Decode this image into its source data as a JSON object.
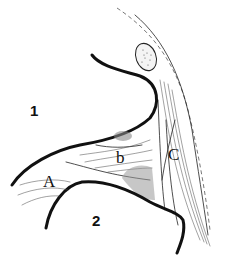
{
  "figure": {
    "type": "anatomical line drawing",
    "labels": {
      "region_1": "1",
      "region_2": "2",
      "structure_A": "A",
      "structure_b": "b",
      "structure_C": "C"
    }
  }
}
